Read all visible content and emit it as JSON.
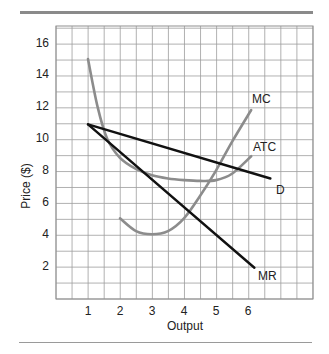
{
  "chart_data": {
    "type": "line",
    "title": "",
    "xlabel": "Output",
    "ylabel": "Price ($)",
    "xlim": [
      0,
      8
    ],
    "ylim": [
      0,
      17
    ],
    "x_ticks": [
      1,
      2,
      3,
      4,
      5,
      6
    ],
    "y_ticks": [
      2,
      4,
      6,
      8,
      10,
      12,
      14,
      16
    ],
    "grid": true,
    "legend": "inline labels",
    "series": [
      {
        "name": "MC",
        "color": "#8c8c8c",
        "points": [
          [
            2,
            5.0
          ],
          [
            2.5,
            4.2
          ],
          [
            3,
            4.0
          ],
          [
            3.5,
            4.2
          ],
          [
            4,
            5.0
          ],
          [
            4.5,
            6.4
          ],
          [
            5,
            8.0
          ],
          [
            5.5,
            9.8
          ],
          [
            6.1,
            11.8
          ]
        ]
      },
      {
        "name": "ATC",
        "color": "#8c8c8c",
        "points": [
          [
            1,
            15.0
          ],
          [
            1.3,
            12.0
          ],
          [
            1.6,
            10.0
          ],
          [
            2,
            8.8
          ],
          [
            2.5,
            8.1
          ],
          [
            3,
            7.7
          ],
          [
            3.5,
            7.5
          ],
          [
            4,
            7.4
          ],
          [
            4.5,
            7.35
          ],
          [
            5,
            7.4
          ],
          [
            5.5,
            7.8
          ],
          [
            6.1,
            8.9
          ]
        ]
      },
      {
        "name": "D",
        "color": "#111111",
        "points": [
          [
            1,
            10.9
          ],
          [
            6.7,
            7.5
          ]
        ]
      },
      {
        "name": "MR",
        "color": "#111111",
        "points": [
          [
            1,
            10.9
          ],
          [
            6.2,
            1.9
          ]
        ]
      }
    ],
    "annotations": [
      {
        "text": "MC",
        "x": 6.0,
        "y": 12.3
      },
      {
        "text": "ATC",
        "x": 6.1,
        "y": 9.4
      },
      {
        "text": "D",
        "x": 6.8,
        "y": 6.7
      },
      {
        "text": "MR",
        "x": 6.4,
        "y": 1.4
      }
    ]
  },
  "labels": {
    "xlabel": "Output",
    "ylabel": "Price ($)",
    "mc": "MC",
    "atc": "ATC",
    "d": "D",
    "mr": "MR"
  },
  "x_tick_labels": [
    "1",
    "2",
    "3",
    "4",
    "5",
    "6"
  ],
  "y_tick_labels": [
    "2",
    "4",
    "6",
    "8",
    "10",
    "12",
    "14",
    "16"
  ]
}
